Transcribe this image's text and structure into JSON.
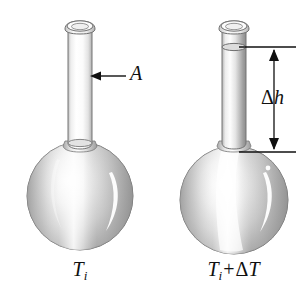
{
  "figure": {
    "kind": "thermal-expansion-flask-diagram",
    "background_color": "#ffffff",
    "ink_color": "#101010",
    "glass_light": "#f2f2f2",
    "glass_mid": "#b8b8b8",
    "glass_dark": "#8f8f8f",
    "glass_outline": "#6e6e6e",
    "highlight_color": "#ffffff"
  },
  "annotations": {
    "area_label": "A",
    "delta_h_label_delta": "Δ",
    "delta_h_label_var": "h",
    "arrow_left_name": "cross-section-area-arrow",
    "dimension_name": "delta-h-dimension-line"
  },
  "left_flask": {
    "caption_symbol": "T",
    "caption_subscript": "i",
    "state": "initial temperature, liquid level at bulb neck",
    "bulb_center_x": 80,
    "bulb_center_y": 196,
    "bulb_radius": 53,
    "neck_top_y": 22,
    "liquid_level_y": 140
  },
  "right_flask": {
    "caption_symbol": "T",
    "caption_subscript": "i",
    "caption_operator": "+",
    "caption_delta": "Δ",
    "caption_variable": "T",
    "state": "raised temperature, liquid risen up the neck",
    "bulb_center_x": 234,
    "bulb_center_y": 200,
    "bulb_radius": 54,
    "neck_top_y": 22,
    "liquid_level_y": 47
  },
  "dimension": {
    "top_y": 47,
    "bottom_y": 152,
    "line_x": 274,
    "tick_left_x": 237,
    "tick_right_x": 296
  }
}
